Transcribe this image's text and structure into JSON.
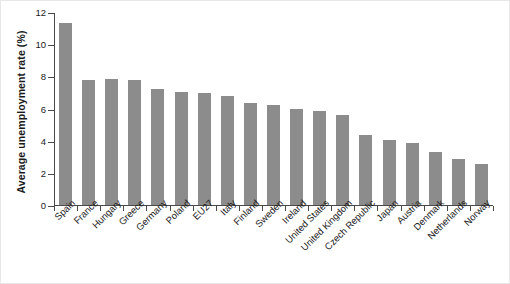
{
  "chart_data": {
    "type": "bar",
    "title": "",
    "xlabel": "",
    "ylabel": "Average unemployment rate (%)",
    "ylim": [
      0,
      12
    ],
    "yticks": [
      0,
      2,
      4,
      6,
      8,
      10,
      12
    ],
    "ytick_labels": [
      "0",
      "2",
      "4",
      "6",
      "8",
      "10",
      "12"
    ],
    "grid": false,
    "legend": null,
    "bar_color": "#8c8c8c",
    "axis_color": "#4a4a4a",
    "categories": [
      "Spain",
      "France",
      "Hungary",
      "Greece",
      "Germany",
      "Poland",
      "EU27",
      "Italy",
      "Finland",
      "Sweden",
      "Ireland",
      "United States",
      "United Kingdom",
      "Czech Republic",
      "Japan",
      "Austria",
      "Denmark",
      "Netherlands",
      "Norway"
    ],
    "values": [
      11.3,
      7.8,
      7.85,
      7.75,
      7.2,
      7.05,
      6.95,
      6.8,
      6.35,
      6.2,
      6.0,
      5.85,
      5.6,
      4.35,
      4.05,
      3.85,
      3.3,
      2.85,
      2.55
    ],
    "series": [
      {
        "name": "Average unemployment rate (%)",
        "values": [
          11.3,
          7.8,
          7.85,
          7.75,
          7.2,
          7.05,
          6.95,
          6.8,
          6.35,
          6.2,
          6.0,
          5.85,
          5.6,
          4.35,
          4.05,
          3.85,
          3.3,
          2.85,
          2.55
        ]
      }
    ]
  }
}
